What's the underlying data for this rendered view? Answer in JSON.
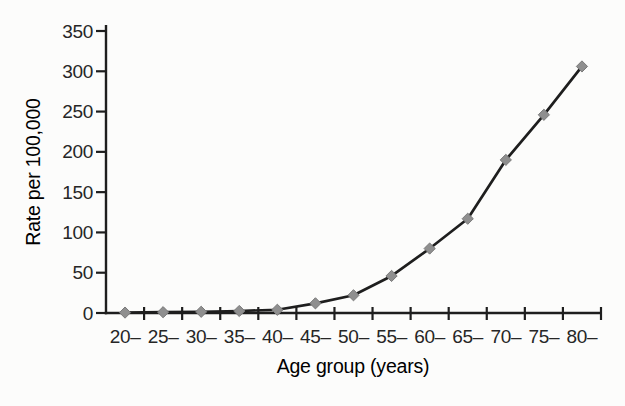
{
  "chart_data": {
    "type": "line",
    "title": "",
    "xlabel": "Age group (years)",
    "ylabel": "Rate per 100,000",
    "categories": [
      "20–",
      "25–",
      "30–",
      "35–",
      "40–",
      "45–",
      "50–",
      "55–",
      "60–",
      "65–",
      "70–",
      "75–",
      "80–"
    ],
    "values": [
      0.5,
      1,
      1.5,
      2.5,
      4,
      12,
      22,
      46,
      80,
      117,
      190,
      246,
      306
    ],
    "ylim": [
      0,
      350
    ],
    "yticks": [
      0,
      50,
      100,
      150,
      200,
      250,
      300,
      350
    ],
    "grid": false,
    "legend": "none",
    "marker": "diamond",
    "colors": {
      "line": "#1e1e1e",
      "axis": "#1e1e1e",
      "marker_fill": "#8f8f8f",
      "marker_edge": "#7a7a7a",
      "text": "#262626",
      "background": "#fcfcfb"
    }
  }
}
